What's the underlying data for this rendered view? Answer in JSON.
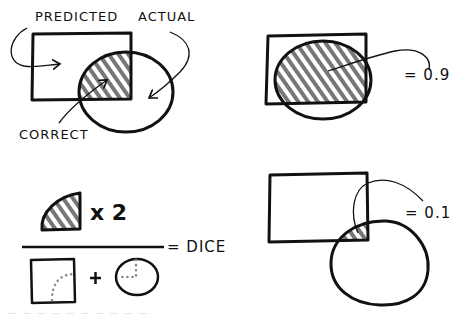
{
  "diagram": {
    "colors": {
      "ink": "#111111",
      "hatch": "#777777",
      "background": "#ffffff",
      "dots": "#888888"
    },
    "panels": [
      {
        "id": "overlap-legend",
        "labels": {
          "predicted": "PREDICTED",
          "actual": "ACTUAL",
          "correct": "CORRECT"
        }
      },
      {
        "id": "high-overlap",
        "value_label": "= 0.9"
      },
      {
        "id": "formula",
        "numerator_multiplier": "x 2",
        "plus": "+",
        "result_label": "= DICE"
      },
      {
        "id": "low-overlap",
        "value_label": "= 0.1"
      }
    ],
    "caption": "— — — — — — — — — —"
  }
}
